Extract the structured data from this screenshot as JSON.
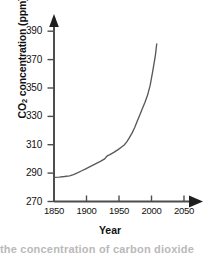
{
  "chart_data": {
    "type": "line",
    "title": "",
    "xlabel": "Year",
    "ylabel": "CO2 concentration (ppm)",
    "ylabel_prefix": "CO",
    "ylabel_sub": "2",
    "ylabel_suffix": " concentration (ppm)",
    "xlim": [
      1850,
      2062
    ],
    "ylim": [
      270,
      396
    ],
    "xticks": [
      1850,
      1900,
      1950,
      2000,
      2050
    ],
    "xtick_labels": [
      "1850",
      "1900",
      "1950",
      "2000",
      "2050"
    ],
    "yticks": [
      270,
      290,
      310,
      330,
      350,
      370,
      390
    ],
    "ytick_labels": [
      "270",
      "290",
      "310",
      "330",
      "350",
      "370",
      "390"
    ],
    "grid": false,
    "legend": "none",
    "series": [
      {
        "name": "Atmospheric CO2 concentration",
        "color": "#595959",
        "x": [
          1850,
          1858,
          1866,
          1874,
          1880,
          1886,
          1892,
          1898,
          1904,
          1910,
          1916,
          1922,
          1928,
          1932,
          1936,
          1942,
          1948,
          1954,
          1958,
          1962,
          1966,
          1970,
          1974,
          1978,
          1982,
          1986,
          1990,
          1994,
          1998,
          2002,
          2006,
          2008
        ],
        "y": [
          287.0,
          287.2,
          287.6,
          288.1,
          289.0,
          290.2,
          291.5,
          292.8,
          294.2,
          295.6,
          297.0,
          298.4,
          300.0,
          302.2,
          303.0,
          304.6,
          306.4,
          308.4,
          309.8,
          312.0,
          315.0,
          318.2,
          322.0,
          326.5,
          331.0,
          335.5,
          340.0,
          345.0,
          352.0,
          362.0,
          373.0,
          381.0
        ]
      }
    ],
    "annotations": [],
    "axis_style": {
      "arrow_heads": true,
      "spines": [
        "left",
        "bottom"
      ],
      "axis_color": "#4d4d4d"
    }
  },
  "caption": {
    "cut_off_text": "the concentration of carbon dioxide"
  }
}
